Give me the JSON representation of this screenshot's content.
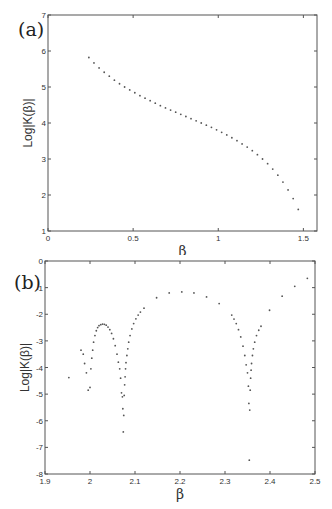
{
  "chart_data": [
    {
      "panel": "(a)",
      "type": "scatter",
      "title": "",
      "xlabel": "β",
      "ylabel": "Log|K(β)|",
      "xlim": [
        0,
        1.58
      ],
      "ylim": [
        1,
        7
      ],
      "xticks": [
        "0",
        "0.5",
        "1",
        "1.5"
      ],
      "yticks": [
        "1",
        "2",
        "3",
        "4",
        "5",
        "6",
        "7"
      ],
      "grid": false,
      "legend": null,
      "x": [
        0.24,
        0.27,
        0.3,
        0.33,
        0.36,
        0.39,
        0.42,
        0.45,
        0.48,
        0.51,
        0.54,
        0.57,
        0.6,
        0.63,
        0.66,
        0.69,
        0.72,
        0.75,
        0.78,
        0.81,
        0.84,
        0.87,
        0.9,
        0.93,
        0.96,
        0.99,
        1.02,
        1.05,
        1.08,
        1.11,
        1.14,
        1.17,
        1.2,
        1.23,
        1.26,
        1.29,
        1.32,
        1.35,
        1.38,
        1.41,
        1.44,
        1.47
      ],
      "y": [
        5.82,
        5.67,
        5.53,
        5.41,
        5.3,
        5.19,
        5.09,
        5.0,
        4.92,
        4.84,
        4.76,
        4.69,
        4.62,
        4.55,
        4.48,
        4.42,
        4.36,
        4.3,
        4.24,
        4.18,
        4.12,
        4.06,
        4.0,
        3.94,
        3.88,
        3.81,
        3.74,
        3.67,
        3.59,
        3.51,
        3.42,
        3.33,
        3.23,
        3.12,
        3.0,
        2.87,
        2.72,
        2.55,
        2.36,
        2.14,
        1.9,
        1.6
      ]
    },
    {
      "panel": "(b)",
      "type": "scatter",
      "title": "",
      "xlabel": "β",
      "ylabel": "Log|K(β)|",
      "xlim": [
        1.9,
        2.5
      ],
      "ylim": [
        -8,
        0
      ],
      "xticks": [
        "1.9",
        "2",
        "2.1",
        "2.2",
        "2.3",
        "2.4",
        "2.5"
      ],
      "yticks": [
        "-8",
        "-7",
        "-6",
        "-5",
        "-4",
        "-3",
        "-2",
        "-1",
        "0"
      ],
      "grid": false,
      "legend": null,
      "x": [
        1.953,
        1.98,
        1.985,
        1.988,
        1.992,
        1.996,
        2.0,
        2.002,
        2.004,
        2.006,
        2.008,
        2.011,
        2.014,
        2.017,
        2.02,
        2.024,
        2.028,
        2.032,
        2.036,
        2.04,
        2.044,
        2.048,
        2.052,
        2.056,
        2.06,
        2.063,
        2.066,
        2.068,
        2.07,
        2.072,
        2.073,
        2.074,
        2.075,
        2.076,
        2.077,
        2.078,
        2.079,
        2.08,
        2.082,
        2.084,
        2.086,
        2.089,
        2.093,
        2.097,
        2.102,
        2.107,
        2.112,
        2.12,
        2.148,
        2.176,
        2.204,
        2.231,
        2.259,
        2.287,
        2.315,
        2.32,
        2.325,
        2.33,
        2.335,
        2.34,
        2.344,
        2.347,
        2.35,
        2.352,
        2.353,
        2.354,
        2.355,
        2.356,
        2.357,
        2.358,
        2.359,
        2.361,
        2.363,
        2.366,
        2.37,
        2.375,
        2.38,
        2.399,
        2.427,
        2.455,
        2.483
      ],
      "y": [
        -4.38,
        -3.35,
        -3.5,
        -3.85,
        -4.2,
        -4.85,
        -4.75,
        -4.05,
        -3.65,
        -3.35,
        -3.05,
        -2.8,
        -2.62,
        -2.5,
        -2.43,
        -2.39,
        -2.37,
        -2.38,
        -2.41,
        -2.48,
        -2.58,
        -2.72,
        -2.92,
        -3.18,
        -3.5,
        -3.8,
        -4.05,
        -4.4,
        -4.95,
        -5.1,
        -5.55,
        -6.42,
        -5.8,
        -5.05,
        -4.65,
        -4.35,
        -4.05,
        -3.82,
        -3.55,
        -3.3,
        -3.05,
        -2.8,
        -2.55,
        -2.35,
        -2.17,
        -2.03,
        -1.92,
        -1.77,
        -1.38,
        -1.2,
        -1.16,
        -1.2,
        -1.35,
        -1.6,
        -2.03,
        -2.18,
        -2.35,
        -2.58,
        -2.85,
        -3.2,
        -3.55,
        -3.9,
        -4.2,
        -4.7,
        -5.35,
        -7.48,
        -5.6,
        -4.85,
        -4.4,
        -4.1,
        -3.85,
        -3.55,
        -3.3,
        -3.05,
        -2.8,
        -2.6,
        -2.45,
        -1.85,
        -1.32,
        -0.95,
        -0.65
      ]
    }
  ],
  "panels": {
    "a": {
      "label": "(a)"
    },
    "b": {
      "label": "(b)"
    }
  }
}
